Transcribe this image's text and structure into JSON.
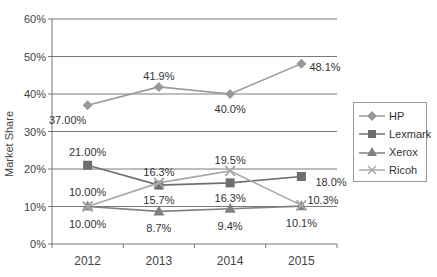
{
  "chart_data": {
    "type": "line",
    "title": "",
    "xlabel": "",
    "ylabel": "Market Share",
    "categories": [
      "2012",
      "2013",
      "2014",
      "2015"
    ],
    "ylim": [
      0,
      60
    ],
    "yticks": [
      "0%",
      "10%",
      "20%",
      "30%",
      "40%",
      "50%",
      "60%"
    ],
    "grid": true,
    "legend_position": "right",
    "series": [
      {
        "name": "HP",
        "marker": "diamond",
        "color": "#999999",
        "values": [
          37.0,
          41.9,
          40.0,
          48.1
        ],
        "labels": [
          "37.00%",
          "41.9%",
          "40.0%",
          "48.1%"
        ]
      },
      {
        "name": "Lexmark",
        "marker": "square",
        "color": "#6e6e6e",
        "values": [
          21.0,
          15.7,
          16.3,
          18.0
        ],
        "labels": [
          "21.00%",
          "15.7%",
          "16.3%",
          "18.0%"
        ]
      },
      {
        "name": "Xerox",
        "marker": "triangle",
        "color": "#808080",
        "values": [
          10.0,
          8.7,
          9.4,
          10.1
        ],
        "labels": [
          "10.00%",
          "8.7%",
          "9.4%",
          "10.1%"
        ]
      },
      {
        "name": "Ricoh",
        "marker": "x",
        "color": "#a8a8a8",
        "values": [
          10.0,
          16.3,
          19.5,
          10.3
        ],
        "labels": [
          "10.00%",
          "16.3%",
          "19.5%",
          "10.3%"
        ]
      }
    ]
  },
  "legend": {
    "items": [
      {
        "label": "HP"
      },
      {
        "label": "Lexmark"
      },
      {
        "label": "Xerox"
      },
      {
        "label": "Ricoh"
      }
    ]
  }
}
